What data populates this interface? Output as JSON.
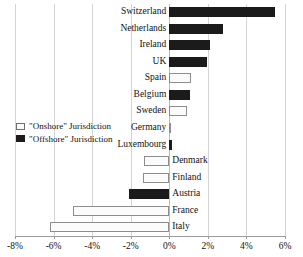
{
  "chart_data": {
    "type": "bar",
    "orientation": "horizontal",
    "title": "",
    "xlabel": "",
    "ylabel": "",
    "xlim": [
      -8,
      6
    ],
    "xticks": [
      -8,
      -6,
      -4,
      -2,
      0,
      2,
      4,
      6
    ],
    "xtick_labels": [
      "-8%",
      "-6%",
      "-4%",
      "-2%",
      "0%",
      "2%",
      "4%",
      "6%"
    ],
    "grid": true,
    "legend_position": "middle-left",
    "categories": [
      "Switzerland",
      "Netherlands",
      "Ireland",
      "UK",
      "Spain",
      "Belgium",
      "Sweden",
      "Germany",
      "Luxembourg",
      "Denmark",
      "Finland",
      "Austria",
      "France",
      "Italy"
    ],
    "values": [
      5.5,
      2.8,
      2.1,
      1.95,
      1.15,
      1.1,
      0.9,
      0.05,
      0.15,
      -1.3,
      -1.35,
      -2.1,
      -5.0,
      -6.2
    ],
    "types": [
      "offshore",
      "offshore",
      "offshore",
      "offshore",
      "onshore",
      "offshore",
      "onshore",
      "onshore",
      "offshore",
      "onshore",
      "onshore",
      "offshore",
      "onshore",
      "onshore"
    ],
    "series": [
      {
        "name": "\"Onshore\" Jurisdiction",
        "color": "#fbfbfb",
        "edge_color": "#8d8d8d"
      },
      {
        "name": "\"Offshore\" Jurisdiction",
        "color": "#1b1b1b",
        "edge_color": "#1b1b1b"
      }
    ]
  },
  "legend": {
    "onshore_label": "\"Onshore\" Jurisdiction",
    "offshore_label": "\"Offshore\" Jurisdiction"
  },
  "colors": {
    "offshore": "#1b1b1b",
    "onshore": "#fbfbfb",
    "onshore_edge": "#8d8d8d",
    "grid": "#d4d4d4",
    "axis": "#9a9a9a",
    "text": "#111111",
    "background": "#ffffff"
  }
}
